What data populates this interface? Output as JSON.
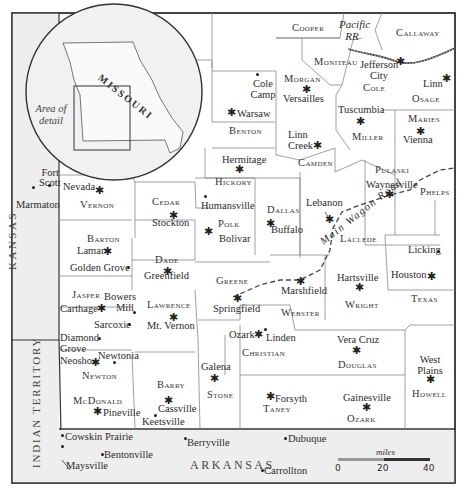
{
  "map": {
    "inset": {
      "state_label": "MISSOURI",
      "area_label": "Area of detail"
    },
    "regions": {
      "kansas": "KANSAS",
      "indian_territory": "INDIAN TERRITORY",
      "arkansas": "ARKANSAS"
    },
    "counties": {
      "cooper": "Cooper",
      "callaway": "Callaway",
      "moniteau": "Moniteau",
      "cole": "Cole",
      "osage": "Osage",
      "morgan": "Morgan",
      "benton": "Benton",
      "miller": "Miller",
      "maries": "Maries",
      "camden": "Camden",
      "hickory": "Hickory",
      "pulaski": "Pulaski",
      "phelps": "Phelps",
      "vernon": "Vernon",
      "cedar": "Cedar",
      "polk": "Polk",
      "dallas": "Dallas",
      "laclede": "Laclede",
      "barton": "Barton",
      "dade": "Dade",
      "greene": "Greene",
      "webster": "Webster",
      "wright": "Wright",
      "texas": "Texas",
      "jasper": "Jasper",
      "lawrence": "Lawrence",
      "christian": "Christian",
      "douglas": "Douglas",
      "newton": "Newton",
      "mcdonald": "McDonald",
      "barry": "Barry",
      "stone": "Stone",
      "taney": "Taney",
      "ozark": "Ozark",
      "howell": "Howell"
    },
    "towns": {
      "cole_camp": "Cole Camp",
      "warsaw": "Warsaw",
      "versailles": "Versailles",
      "jefferson_city": "Jefferson City",
      "linn": "Linn",
      "tuscumbia": "Tuscumbia",
      "vienna": "Vienna",
      "linn_creek": "Linn Creek",
      "hermitage": "Hermitage",
      "waynesville": "Waynesville",
      "humansville": "Humansville",
      "lebanon": "Lebanon",
      "buffalo": "Buffalo",
      "bolivar": "Bolivar",
      "fort_scott": "Fort Scott",
      "marmaton": "Marmaton",
      "nevada": "Nevada",
      "stockton": "Stockton",
      "lamar": "Lamar",
      "golden_grove": "Golden Grove",
      "greenfield": "Greenfield",
      "carthage": "Carthage",
      "bowers_mill": "Bowers Mill",
      "sarcoxie": "Sarcoxie",
      "mt_vernon": "Mt. Vernon",
      "springfield": "Springfield",
      "marshfield": "Marshfield",
      "hartsville": "Hartsville",
      "licking": "Licking",
      "houston": "Houston",
      "diamond_grove": "Diamond Grove",
      "neosho": "Neosho",
      "newtonia": "Newtonia",
      "ozark": "Ozark",
      "linden": "Linden",
      "vera_cruz": "Vera Cruz",
      "west_plains": "West Plains",
      "galena": "Galena",
      "forsyth": "Forsyth",
      "gainesville": "Gainesville",
      "pineville": "Pineville",
      "cassville": "Cassville",
      "keetsville": "Keetsville",
      "cowskin_prairie": "Cowskin Prairie",
      "bentonville": "Bentonville",
      "maysville": "Maysville",
      "berryville": "Berryville",
      "dubuque": "Dubuque",
      "carrollton": "Carrollton"
    },
    "routes": {
      "railroad": "Pacific RR",
      "road": "Main Wagon Road"
    },
    "scale": {
      "unit": "miles",
      "ticks": [
        "0",
        "20",
        "40"
      ]
    }
  }
}
